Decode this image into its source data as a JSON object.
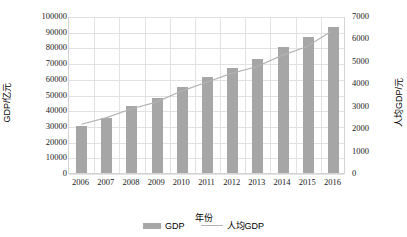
{
  "chart_data": {
    "type": "bar",
    "title": "",
    "xlabel": "年份",
    "ylabel": "GDP/亿元",
    "y2label": "人均GDP/元",
    "categories": [
      "2006",
      "2007",
      "2008",
      "2009",
      "2010",
      "2011",
      "2012",
      "2013",
      "2014",
      "2015",
      "2016"
    ],
    "ylim": [
      0,
      100000
    ],
    "y2lim": [
      0,
      7000
    ],
    "yticks": [
      "0",
      "10000",
      "20000",
      "30000",
      "40000",
      "50000",
      "60000",
      "70000",
      "80000",
      "90000",
      "100000"
    ],
    "y2ticks": [
      "0",
      "1000",
      "2000",
      "3000",
      "4000",
      "5000",
      "6000",
      "7000"
    ],
    "grid": true,
    "legend_position": "bottom",
    "series": [
      {
        "name": "GDP",
        "type": "bar",
        "axis": "left",
        "color": "#a6a6a6",
        "values": [
          30000,
          35000,
          42500,
          47500,
          55000,
          61000,
          67000,
          72500,
          80500,
          86500,
          93000
        ]
      },
      {
        "name": "人均GDP",
        "type": "line",
        "axis": "right",
        "color": "#b3b3b3",
        "values": [
          2200,
          2500,
          2900,
          3200,
          3700,
          4100,
          4500,
          4800,
          5300,
          5700,
          6400
        ]
      }
    ]
  },
  "legend": {
    "items": [
      {
        "label": "GDP",
        "marker": "bar-swatch"
      },
      {
        "label": "人均GDP",
        "marker": "line-swatch"
      }
    ]
  }
}
